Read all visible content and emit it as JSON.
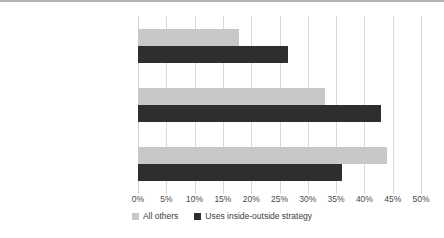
{
  "chart_data": {
    "type": "bar",
    "orientation": "horizontal",
    "title": "",
    "xlabel": "",
    "ylabel": "",
    "xlim": [
      0,
      50
    ],
    "xtick_labels": [
      "0%",
      "5%",
      "10%",
      "15%",
      "20%",
      "25%",
      "30%",
      "35%",
      "40%",
      "45%",
      "50%"
    ],
    "xticks": [
      0,
      5,
      10,
      15,
      20,
      25,
      30,
      35,
      40,
      45,
      50
    ],
    "grid": true,
    "legend_position": "bottom",
    "categories": [
      "organizational memberships",
      "individual memberships",
      "no memberships"
    ],
    "series": [
      {
        "name": "All others",
        "color": "#c8c8c8",
        "values": [
          17.8,
          33.0,
          44.0
        ]
      },
      {
        "name": "Uses inside-outside strategy",
        "color": "#2e2e2e",
        "values": [
          26.5,
          43.0,
          36.0
        ]
      }
    ]
  }
}
